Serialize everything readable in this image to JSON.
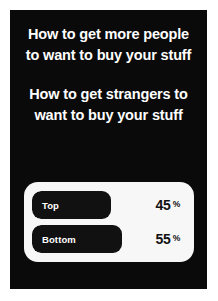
{
  "story": {
    "background_color": "#0a0a0a",
    "text_color": "#ffffff",
    "captions": [
      "How to get more people to want to buy your stuff",
      "How to get strangers to want to buy your stuff"
    ]
  },
  "poll": {
    "card_color": "#f7f7f8",
    "fill_color": "#111111",
    "options": [
      {
        "label": "Top",
        "percent_value": "45",
        "percent_sign": "%",
        "fill_ratio": 0.45
      },
      {
        "label": "Bottom",
        "percent_value": "55",
        "percent_sign": "%",
        "fill_ratio": 0.55
      }
    ]
  },
  "chart_data": {
    "type": "bar",
    "categories": [
      "Top",
      "Bottom"
    ],
    "values": [
      45,
      55
    ],
    "unit": "%",
    "xlabel": "",
    "ylabel": "",
    "ylim": [
      0,
      100
    ],
    "grid": false,
    "legend": "none",
    "orientation": "horizontal"
  }
}
